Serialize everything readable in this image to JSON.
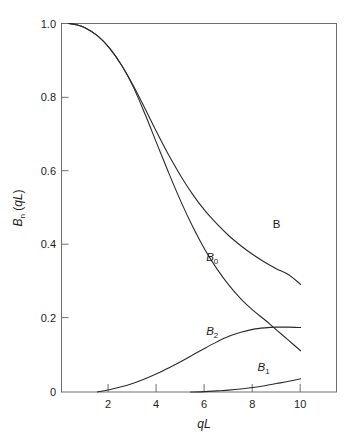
{
  "chart_data": {
    "type": "line",
    "title": "",
    "xlabel": "qL",
    "ylabel": "Bn (qL)",
    "xlim": [
      0,
      11.5
    ],
    "ylim": [
      0,
      1.0
    ],
    "grid": false,
    "legend_position": "inline-curve-labels",
    "xticks": [
      2,
      4,
      6,
      8,
      10
    ],
    "xtick_labels": [
      "2",
      "4",
      "6",
      "8",
      "10"
    ],
    "yticks": [
      0,
      0.2,
      0.4,
      0.6,
      0.8,
      1.0
    ],
    "ytick_labels": [
      "0",
      "0.2",
      "0.4",
      "0.6",
      "0.8",
      "1.0"
    ],
    "series": [
      {
        "name": "B",
        "label": "B",
        "label_x": 9.0,
        "label_y": 0.445,
        "x": [
          0.3,
          0.6,
          1.0,
          1.5,
          2.0,
          2.5,
          3.0,
          3.5,
          4.0,
          4.5,
          5.0,
          5.5,
          6.0,
          6.5,
          7.0,
          7.5,
          8.0,
          8.5,
          9.0,
          9.5,
          10.0
        ],
        "y": [
          1.0,
          0.997,
          0.988,
          0.967,
          0.934,
          0.888,
          0.832,
          0.768,
          0.703,
          0.641,
          0.585,
          0.535,
          0.492,
          0.456,
          0.424,
          0.397,
          0.373,
          0.352,
          0.334,
          0.318,
          0.292
        ]
      },
      {
        "name": "B0",
        "label": "B0",
        "label_x": 6.3,
        "label_y": 0.355,
        "x": [
          0.3,
          0.6,
          1.0,
          1.5,
          2.0,
          2.5,
          3.0,
          3.5,
          4.0,
          4.5,
          5.0,
          5.5,
          6.0,
          6.5,
          7.0,
          7.5,
          8.0,
          8.5,
          9.0,
          9.5,
          10.0
        ],
        "y": [
          1.0,
          0.997,
          0.988,
          0.967,
          0.934,
          0.888,
          0.828,
          0.753,
          0.672,
          0.592,
          0.516,
          0.447,
          0.386,
          0.334,
          0.29,
          0.253,
          0.222,
          0.196,
          0.168,
          0.14,
          0.112
        ]
      },
      {
        "name": "B2",
        "label": "B2",
        "label_x": 6.3,
        "label_y": 0.155,
        "x": [
          1.5,
          2.0,
          2.5,
          3.0,
          3.5,
          4.0,
          4.5,
          5.0,
          5.5,
          6.0,
          6.5,
          7.0,
          7.5,
          8.0,
          8.5,
          9.0,
          9.5,
          10.0
        ],
        "y": [
          0.0,
          0.006,
          0.014,
          0.024,
          0.036,
          0.05,
          0.066,
          0.083,
          0.101,
          0.119,
          0.136,
          0.151,
          0.162,
          0.17,
          0.174,
          0.176,
          0.176,
          0.175
        ]
      },
      {
        "name": "B1",
        "label": "B1",
        "label_x": 8.45,
        "label_y": 0.057,
        "x": [
          5.4,
          6.0,
          6.5,
          7.0,
          7.5,
          8.0,
          8.5,
          9.0,
          9.5,
          10.0
        ],
        "y": [
          0.0,
          0.001,
          0.003,
          0.005,
          0.008,
          0.012,
          0.017,
          0.023,
          0.029,
          0.036
        ]
      }
    ]
  },
  "axes": {
    "y_title_main": "B",
    "y_title_sub": "n",
    "y_title_tail": " (qL)",
    "x_title": "qL",
    "tick_0": "0",
    "tick_02": "0.2",
    "tick_04": "0.4",
    "tick_06": "0.6",
    "tick_08": "0.8",
    "tick_10": "1.0",
    "xtick_2": "2",
    "xtick_4": "4",
    "xtick_6": "6",
    "xtick_8": "8",
    "xtick_10": "10"
  },
  "labels": {
    "b": "B",
    "b0_main": "B",
    "b0_sub": "0",
    "b1_main": "B",
    "b1_sub": "1",
    "b2_main": "B",
    "b2_sub": "2"
  },
  "colors": {
    "curve": "#2a2a2a",
    "frame": "#6e6e6e",
    "background": "#ffffff",
    "text": "#1c1c1c"
  }
}
